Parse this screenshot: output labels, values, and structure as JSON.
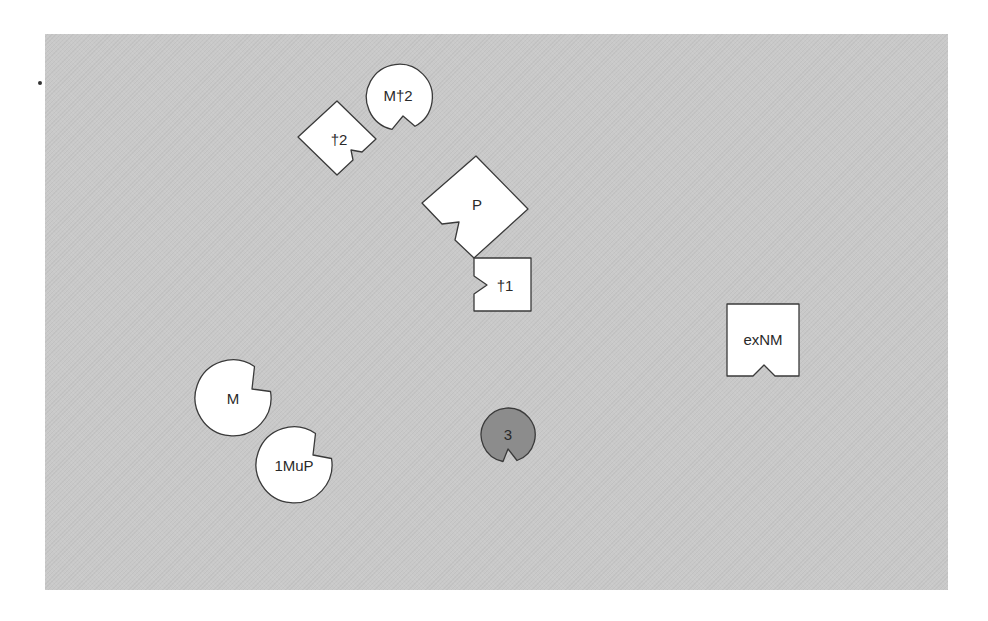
{
  "diagram": {
    "background_color": "#c9c9c9",
    "shape_fill": "#ffffff",
    "highlight_fill": "#8c8c8c",
    "stroke_color": "#3a3a3a",
    "nodes": [
      {
        "id": "Mdag2",
        "label": "M†2",
        "shape": "notched-circle",
        "fill": "white"
      },
      {
        "id": "dag2",
        "label": "†2",
        "shape": "notched-diamond",
        "fill": "white"
      },
      {
        "id": "P",
        "label": "P",
        "shape": "notched-diamond",
        "fill": "white"
      },
      {
        "id": "dag1",
        "label": "†1",
        "shape": "notched-square",
        "fill": "white"
      },
      {
        "id": "exNM",
        "label": "exNM",
        "shape": "notched-square",
        "fill": "white"
      },
      {
        "id": "M",
        "label": "M",
        "shape": "notched-circle",
        "fill": "white"
      },
      {
        "id": "1MuP",
        "label": "1MuP",
        "shape": "notched-circle",
        "fill": "white"
      },
      {
        "id": "3",
        "label": "3",
        "shape": "notched-circle",
        "fill": "gray"
      }
    ]
  }
}
